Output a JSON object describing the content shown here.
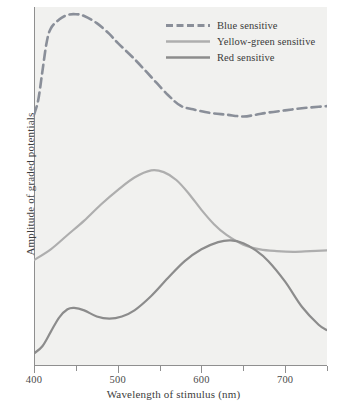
{
  "chart_data": {
    "type": "line",
    "title": "",
    "xlabel": "Wavelength of stimulus (nm)",
    "ylabel": "Amplitude of graded potentials",
    "xlim": [
      400,
      750
    ],
    "ylim": [
      0,
      1
    ],
    "grid": false,
    "legend_position": "top-right",
    "x_ticks": [
      400,
      450,
      500,
      550,
      600,
      650,
      700,
      750
    ],
    "x_tick_labels": [
      "400",
      "",
      "500",
      "",
      "600",
      "",
      "700",
      ""
    ],
    "y_ticks": [],
    "y_tick_labels": [],
    "series": [
      {
        "name": "Blue sensitive",
        "style": "dashed",
        "color": "#8a8f99",
        "x": [
          400,
          405,
          410,
          415,
          420,
          430,
          440,
          450,
          460,
          475,
          490,
          500,
          520,
          540,
          560,
          575,
          590,
          610,
          630,
          650,
          665,
          680,
          700,
          720,
          740,
          750
        ],
        "y": [
          0.7,
          0.74,
          0.82,
          0.9,
          0.94,
          0.965,
          0.978,
          0.98,
          0.975,
          0.955,
          0.925,
          0.9,
          0.855,
          0.805,
          0.755,
          0.725,
          0.715,
          0.705,
          0.7,
          0.695,
          0.7,
          0.706,
          0.712,
          0.718,
          0.722,
          0.724
        ]
      },
      {
        "name": "Yellow-green sensitive",
        "style": "solid",
        "color": "#aeaeae",
        "x": [
          400,
          420,
          440,
          460,
          480,
          500,
          520,
          540,
          555,
          570,
          585,
          600,
          615,
          630,
          650,
          670,
          690,
          710,
          730,
          750
        ],
        "y": [
          0.295,
          0.325,
          0.365,
          0.405,
          0.45,
          0.49,
          0.525,
          0.545,
          0.54,
          0.518,
          0.48,
          0.435,
          0.395,
          0.365,
          0.338,
          0.325,
          0.32,
          0.318,
          0.32,
          0.322
        ]
      },
      {
        "name": "Red sensitive",
        "style": "solid",
        "color": "#8c8c8c",
        "x": [
          400,
          410,
          420,
          430,
          440,
          448,
          460,
          475,
          490,
          505,
          520,
          540,
          560,
          580,
          600,
          620,
          635,
          650,
          665,
          680,
          700,
          720,
          740,
          750
        ],
        "y": [
          0.035,
          0.055,
          0.095,
          0.135,
          0.158,
          0.162,
          0.155,
          0.138,
          0.132,
          0.138,
          0.155,
          0.195,
          0.245,
          0.292,
          0.325,
          0.345,
          0.35,
          0.342,
          0.322,
          0.292,
          0.235,
          0.165,
          0.115,
          0.1
        ]
      }
    ]
  },
  "axes": {
    "x_title": "Wavelength of stimulus (nm)",
    "y_title": "Amplitude of graded potentials",
    "tick_labels": [
      {
        "value": 400,
        "label": "400"
      },
      {
        "value": 500,
        "label": "500"
      },
      {
        "value": 600,
        "label": "600"
      },
      {
        "value": 700,
        "label": "700"
      }
    ]
  },
  "legend": {
    "items": [
      {
        "label": "Blue sensitive",
        "color": "#8a8f99",
        "style": "dashed"
      },
      {
        "label": "Yellow-green sensitive",
        "color": "#aeaeae",
        "style": "solid"
      },
      {
        "label": "Red sensitive",
        "color": "#8c8c8c",
        "style": "solid"
      }
    ]
  }
}
